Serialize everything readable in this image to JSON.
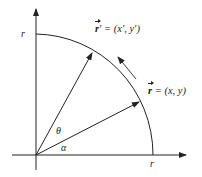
{
  "diagram": {
    "title": "",
    "colors": {
      "stroke": "#222222",
      "background": "#ffffff"
    },
    "origin": {
      "x": 36,
      "y": 155
    },
    "radius_px": 117,
    "axes": {
      "x_axis": {
        "label": "",
        "tick_label": "r"
      },
      "y_axis": {
        "label": "",
        "tick_label": "r"
      }
    },
    "vectors": [
      {
        "id": "r",
        "symbol": "r",
        "prime": "",
        "equals": "= (x, y)",
        "angle_deg": 25
      },
      {
        "id": "r_prime",
        "symbol": "r",
        "prime": "′",
        "equals": "= (x′, y′)",
        "angle_deg": 62
      }
    ],
    "angles": [
      {
        "symbol": "α",
        "meaning": "angle of r from x-axis"
      },
      {
        "symbol": "θ",
        "meaning": "rotation angle from r to r′"
      }
    ],
    "rotation_arrow": {
      "direction": "counterclockwise"
    }
  }
}
